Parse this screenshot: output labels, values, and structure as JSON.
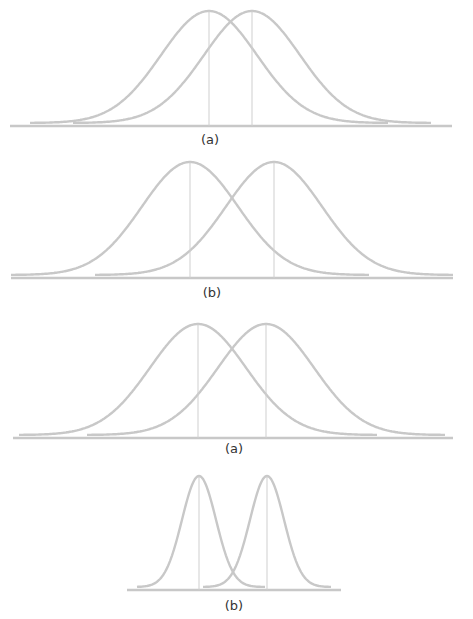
{
  "panels": [
    {
      "id": "p1",
      "label": "(a)",
      "axis": {
        "x1": 10,
        "x2": 452,
        "y": 126
      },
      "baseline_y": 123,
      "peak_y": 11,
      "curves": [
        {
          "mean_x": 209,
          "sigma": 48,
          "x_start": 30,
          "x_end": 388
        },
        {
          "mean_x": 252,
          "sigma": 48,
          "x_start": 73,
          "x_end": 431
        }
      ],
      "label_pos": {
        "x": 210,
        "y": 144
      }
    },
    {
      "id": "p2",
      "label": "(b)",
      "axis": {
        "x1": 11,
        "x2": 453,
        "y": 278
      },
      "baseline_y": 275,
      "peak_y": 162,
      "curves": [
        {
          "mean_x": 190,
          "sigma": 48,
          "x_start": 11,
          "x_end": 369
        },
        {
          "mean_x": 274,
          "sigma": 48,
          "x_start": 95,
          "x_end": 453
        }
      ],
      "label_pos": {
        "x": 212,
        "y": 297
      }
    },
    {
      "id": "p3",
      "label": "(a)",
      "axis": {
        "x1": 13,
        "x2": 453,
        "y": 438
      },
      "baseline_y": 435,
      "peak_y": 324,
      "curves": [
        {
          "mean_x": 198,
          "sigma": 48,
          "x_start": 19,
          "x_end": 377
        },
        {
          "mean_x": 266,
          "sigma": 48,
          "x_start": 87,
          "x_end": 445
        }
      ],
      "label_pos": {
        "x": 234,
        "y": 453
      }
    },
    {
      "id": "p4",
      "label": "(b)",
      "axis": {
        "x1": 127,
        "x2": 341,
        "y": 590
      },
      "baseline_y": 587,
      "peak_y": 476,
      "curves": [
        {
          "mean_x": 199,
          "sigma": 17,
          "x_start": 137,
          "x_end": 265
        },
        {
          "mean_x": 267,
          "sigma": 17,
          "x_start": 203,
          "x_end": 331
        }
      ],
      "label_pos": {
        "x": 234,
        "y": 610
      }
    }
  ],
  "colors": {
    "curve": "#c8c8c8",
    "axis": "#c8c8c8",
    "mean_line": "#cfcfcf",
    "caption": "#333333"
  }
}
